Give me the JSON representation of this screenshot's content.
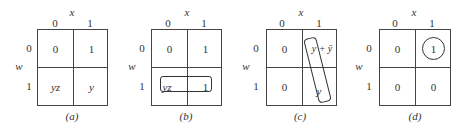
{
  "common": {
    "col_var": "x",
    "row_var": "w",
    "col_labels": [
      "0",
      "1"
    ],
    "row_labels": [
      "0",
      "1"
    ]
  },
  "maps": [
    {
      "caption": "(a)",
      "cells": [
        "0",
        "1",
        "yz",
        "y"
      ]
    },
    {
      "caption": "(b)",
      "cells": [
        "0",
        "1",
        "yz",
        "1"
      ],
      "grouping": "horizontal loop around row w=1"
    },
    {
      "caption": "(c)",
      "cells": [
        "0",
        "y + ȳ",
        "0",
        "y"
      ],
      "grouping": "vertical loop around y terms in column x=1"
    },
    {
      "caption": "(d)",
      "cells": [
        "0",
        "1",
        "0",
        "0"
      ],
      "grouping": "circle around 1 at w=0,x=1"
    }
  ]
}
